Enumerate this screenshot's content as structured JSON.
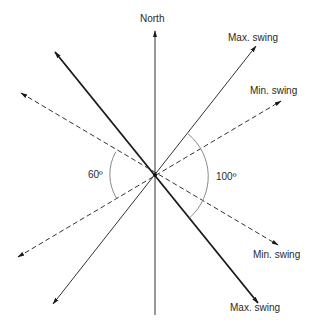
{
  "diagram": {
    "title": "",
    "center": {
      "x": 155,
      "y": 175
    },
    "colors": {
      "line": "#1a1a1a",
      "arc": "#8a8a8a",
      "background": "#ffffff"
    },
    "labels": {
      "north": "North",
      "max_swing_ne": "Max. swing",
      "min_swing_ne": "Min. swing",
      "min_swing_se": "Min. swing",
      "max_swing_se": "Max. swing",
      "angle_left": "60º",
      "angle_right": "100º"
    },
    "axes": [
      {
        "name": "north-axis",
        "style": "solid-thin",
        "from": [
          155,
          315
        ],
        "to": [
          155,
          30
        ]
      },
      {
        "name": "max-swing-axis-a",
        "style": "solid-thin",
        "from": [
          53,
          304
        ],
        "to": [
          256,
          46
        ]
      },
      {
        "name": "max-swing-axis-b",
        "style": "solid-thick",
        "from": [
          55,
          52
        ],
        "to": [
          258,
          303
        ]
      },
      {
        "name": "min-swing-axis-a",
        "style": "dashed",
        "from": [
          18,
          257
        ],
        "to": [
          281,
          101
        ]
      },
      {
        "name": "min-swing-axis-b",
        "style": "dashed",
        "from": [
          21,
          93
        ],
        "to": [
          278,
          245
        ]
      }
    ],
    "angles": [
      {
        "label": "60º",
        "between": [
          "min-swing-axis-a",
          "min-swing-axis-b"
        ],
        "side": "west"
      },
      {
        "label": "100º",
        "between": [
          "max-swing-axis-a",
          "max-swing-axis-b"
        ],
        "side": "east"
      }
    ]
  }
}
